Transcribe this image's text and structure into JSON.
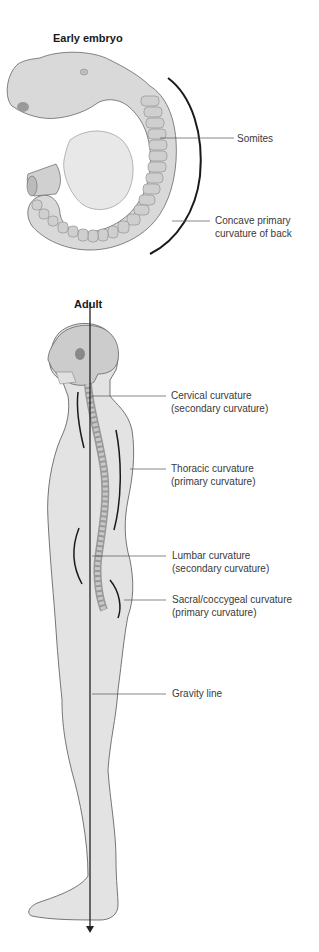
{
  "embryo": {
    "title": "Early embryo",
    "labels": {
      "somites": "Somites",
      "concave_line1": "Concave primary",
      "concave_line2": "curvature of back"
    }
  },
  "adult": {
    "title": "Adult",
    "labels": {
      "cervical_line1": "Cervical curvature",
      "cervical_line2": "(secondary curvature)",
      "thoracic_line1": "Thoracic curvature",
      "thoracic_line2": "(primary curvature)",
      "lumbar_line1": "Lumbar curvature",
      "lumbar_line2": "(secondary curvature)",
      "sacral_line1": "Sacral/coccygeal curvature",
      "sacral_line2": "(primary curvature)",
      "gravity": "Gravity line"
    }
  },
  "colors": {
    "body_fill": "#e3e3e3",
    "outline": "#555555",
    "curve_line": "#1a1a1a",
    "leader_line": "#555555"
  }
}
